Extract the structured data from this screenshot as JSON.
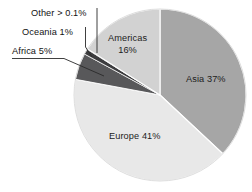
{
  "chart_data": {
    "type": "pie",
    "title": "",
    "subtitle": "",
    "xlabel": "",
    "ylabel": "",
    "legend_position": "none",
    "grid": false,
    "start_angle_deg": 0,
    "direction": "clockwise",
    "categories": [
      "Asia",
      "Europe",
      "Africa",
      "Oceania",
      "Other",
      "Americas"
    ],
    "values": [
      37,
      41,
      5,
      1,
      0.1,
      16
    ],
    "value_unit": "percent",
    "slices": [
      {
        "name": "Asia",
        "label": "Asia 37%",
        "value": 37,
        "value_text": "37%",
        "color": "#a6a6a6",
        "label_placement": "inside"
      },
      {
        "name": "Europe",
        "label": "Europe 41%",
        "value": 41,
        "value_text": "41%",
        "color": "#e8e8e8",
        "label_placement": "inside"
      },
      {
        "name": "Africa",
        "label": "Africa 5%",
        "value": 5,
        "value_text": "5%",
        "color": "#58585a",
        "label_placement": "callout-left"
      },
      {
        "name": "Oceania",
        "label": "Oceania 1%",
        "value": 1,
        "value_text": "1%",
        "color": "#3c3c3e",
        "label_placement": "callout-left"
      },
      {
        "name": "Other",
        "label": "Other > 0.1%",
        "value": 0.1,
        "value_text": "> 0.1%",
        "color": "#17171a",
        "label_placement": "callout-left"
      },
      {
        "name": "Americas",
        "label": "Americas 16%",
        "label_line1": "Americas",
        "label_line2": "16%",
        "value": 16,
        "value_text": "16%",
        "color": "#d2d2d2",
        "label_placement": "inside"
      }
    ]
  },
  "style": {
    "background": "#ffffff",
    "slice_border": "#ffffff",
    "leader_line": "#2a2a2a",
    "text": "#1c1c1c"
  }
}
